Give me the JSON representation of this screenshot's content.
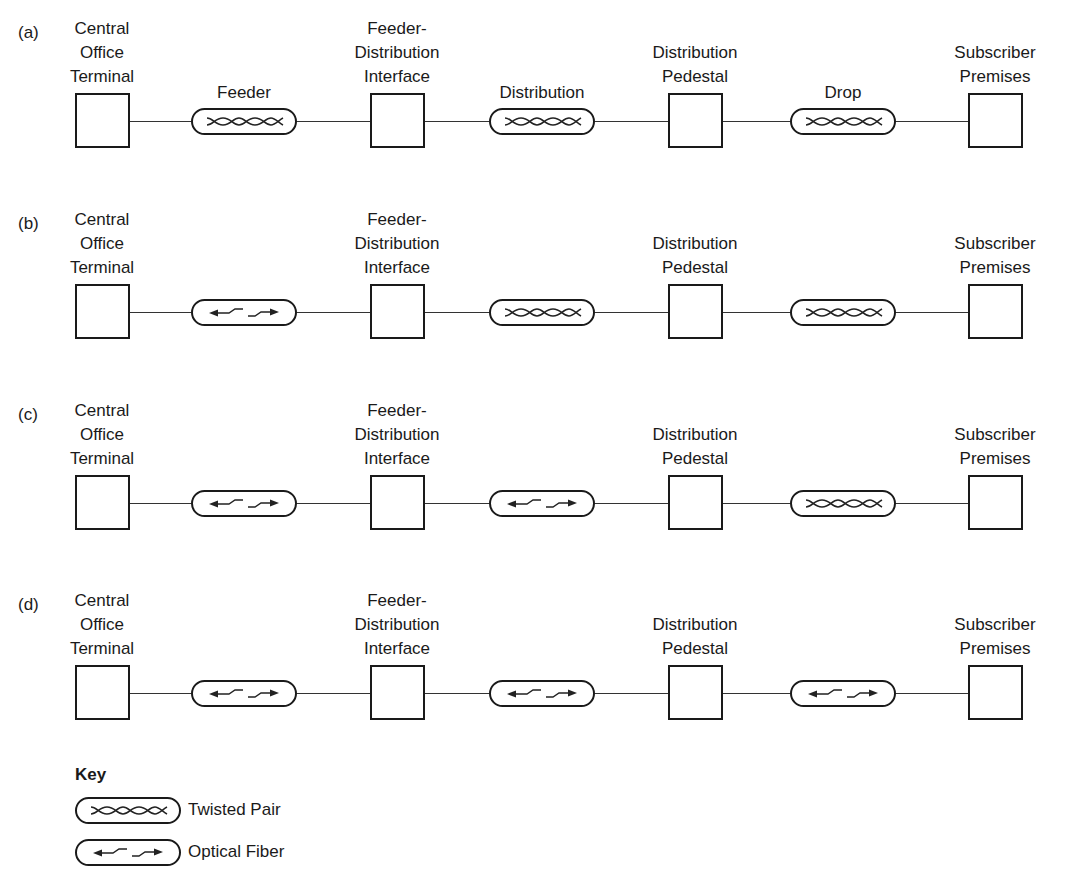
{
  "nodes": [
    {
      "id": "co",
      "label_lines": [
        "Central",
        "Office",
        "Terminal"
      ]
    },
    {
      "id": "fdi",
      "label_lines": [
        "Feeder-",
        "Distribution",
        "Interface"
      ]
    },
    {
      "id": "dp",
      "label_lines": [
        "Distribution",
        "Pedestal"
      ]
    },
    {
      "id": "sp",
      "label_lines": [
        "Subscriber",
        "Premises"
      ]
    }
  ],
  "segment_labels": [
    "Feeder",
    "Distribution",
    "Drop"
  ],
  "rows": [
    {
      "tag": "(a)",
      "segments": [
        "twisted-pair",
        "twisted-pair",
        "twisted-pair"
      ],
      "show_segment_labels": true
    },
    {
      "tag": "(b)",
      "segments": [
        "optical-fiber",
        "twisted-pair",
        "twisted-pair"
      ],
      "show_segment_labels": false
    },
    {
      "tag": "(c)",
      "segments": [
        "optical-fiber",
        "optical-fiber",
        "twisted-pair"
      ],
      "show_segment_labels": false
    },
    {
      "tag": "(d)",
      "segments": [
        "optical-fiber",
        "optical-fiber",
        "optical-fiber"
      ],
      "show_segment_labels": false
    }
  ],
  "key": {
    "title": "Key",
    "items": [
      {
        "type": "twisted-pair",
        "label": "Twisted Pair"
      },
      {
        "type": "optical-fiber",
        "label": "Optical Fiber"
      }
    ]
  }
}
